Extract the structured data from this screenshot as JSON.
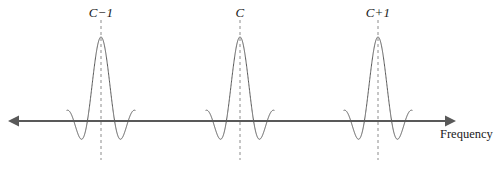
{
  "figure": {
    "title": "",
    "background": "#ffffff",
    "width": 500,
    "height": 170
  },
  "labels": {
    "channel_prev": "C−1",
    "channel_center": "C",
    "channel_next": "C+1",
    "axis_x": "Frequency"
  },
  "colors": {
    "curve": "#595959",
    "axis": "#595959",
    "dashed": "#8c8c8c",
    "text": "#1a1a1a"
  },
  "chart_data": {
    "type": "line",
    "title": "",
    "xlabel": "Frequency",
    "ylabel": "",
    "grid": false,
    "legend": null,
    "axis": {
      "baseline_y_px": 121,
      "x_start_px": 8,
      "x_end_px": 456,
      "arrow_left": true,
      "arrow_right": true,
      "style": "double-headed-arrow"
    },
    "series": [
      {
        "name": "channel C-1 spectrum",
        "shape": "sinc",
        "center_px": 101,
        "peak_amplitude_px": 84,
        "lobe_half_width_px": 13.6,
        "lobes_each_side": 2.5,
        "label": "C−1"
      },
      {
        "name": "channel C spectrum",
        "shape": "sinc",
        "center_px": 240,
        "peak_amplitude_px": 84,
        "lobe_half_width_px": 13.6,
        "lobes_each_side": 2.5,
        "label": "C"
      },
      {
        "name": "channel C+1 spectrum",
        "shape": "sinc",
        "center_px": 378,
        "peak_amplitude_px": 84,
        "lobe_half_width_px": 13.6,
        "lobes_each_side": 2.5,
        "label": "C+1"
      }
    ],
    "markers": [
      {
        "name": "dashed-marker-C-1",
        "x_px": 101,
        "label": "C−1",
        "top_px": 20,
        "bottom_px": 160
      },
      {
        "name": "dashed-marker-C",
        "x_px": 240,
        "label": "C",
        "top_px": 20,
        "bottom_px": 160
      },
      {
        "name": "dashed-marker-C+1",
        "x_px": 378,
        "label": "C+1",
        "top_px": 20,
        "bottom_px": 160
      }
    ],
    "annotations": [
      {
        "name": "frequency-axis-label",
        "text": "Frequency",
        "x_px": 440,
        "y_px": 136
      }
    ]
  }
}
